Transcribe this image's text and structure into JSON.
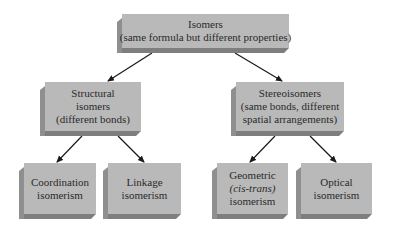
{
  "diagram": {
    "root": {
      "lines": [
        "Isomers",
        "(same formula but different properties)"
      ]
    },
    "level2": [
      {
        "id": "structural",
        "lines": [
          "Structural",
          "isomers",
          "(different bonds)"
        ]
      },
      {
        "id": "stereo",
        "lines": [
          "Stereoisomers",
          "(same bonds, different",
          "spatial arrangements)"
        ]
      }
    ],
    "level3": [
      {
        "id": "coordination",
        "parent": "structural",
        "lines": [
          "Coordination",
          "isomerism"
        ]
      },
      {
        "id": "linkage",
        "parent": "structural",
        "lines": [
          "Linkage",
          "isomerism"
        ]
      },
      {
        "id": "geometric",
        "parent": "stereo",
        "lines": [
          "Geometric",
          "(cis-trans)",
          "isomerism"
        ]
      },
      {
        "id": "optical",
        "parent": "stereo",
        "lines": [
          "Optical",
          "isomerism"
        ]
      }
    ],
    "edges": [
      [
        "root",
        "structural"
      ],
      [
        "root",
        "stereo"
      ],
      [
        "structural",
        "coordination"
      ],
      [
        "structural",
        "linkage"
      ],
      [
        "stereo",
        "geometric"
      ],
      [
        "stereo",
        "optical"
      ]
    ],
    "colors": {
      "box_front": "#b9b9b9",
      "box_side": "#8f8f8f",
      "box_bottom": "#7e7e7e",
      "arrow": "#1a1a1a"
    }
  }
}
